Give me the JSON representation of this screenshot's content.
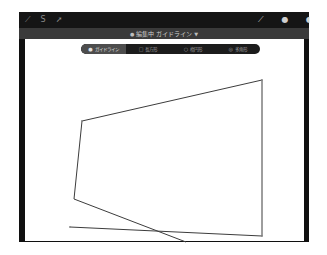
{
  "toolbar": {
    "left_icons": [
      {
        "name": "modify-icon",
        "glyph": "⟋"
      },
      {
        "name": "selection-icon",
        "glyph": "S"
      },
      {
        "name": "transform-icon",
        "glyph": "➚"
      }
    ],
    "right_icons": [
      {
        "name": "brush-icon",
        "glyph": "⟋"
      },
      {
        "name": "smudge-icon",
        "glyph": "●"
      },
      {
        "name": "eraser-icon",
        "glyph": "◖"
      }
    ]
  },
  "title_band": {
    "dot": "●",
    "title": "編集中 ガイドライン",
    "arrow": "▼"
  },
  "guide_modes": [
    {
      "label": "ガイドライン",
      "icon": "●",
      "selected": true
    },
    {
      "label": "長方形",
      "icon": "□",
      "selected": false
    },
    {
      "label": "楕円形",
      "icon": "○",
      "selected": false
    },
    {
      "label": "多角形",
      "icon": "◎",
      "selected": false
    }
  ],
  "colors": {
    "frame": "#101010",
    "toolbar": "#151515",
    "title_band": "#3a3a3a",
    "stroke": "#3c3c3c",
    "segment_selected": "#4d4d4d"
  },
  "drawing": {
    "polygon_points": "82,121 262,80 262,236 70,227",
    "polygon_edges": [
      {
        "x1": 82,
        "y1": 121,
        "x2": 262,
        "y2": 80
      },
      {
        "x1": 262,
        "y1": 80,
        "x2": 262,
        "y2": 236
      },
      {
        "x1": 262,
        "y1": 236,
        "x2": 70,
        "y2": 227
      },
      {
        "x1": 82,
        "y1": 121,
        "x2": 74,
        "y2": 199
      },
      {
        "x1": 74,
        "y1": 199,
        "x2": 186,
        "y2": 242
      }
    ]
  }
}
